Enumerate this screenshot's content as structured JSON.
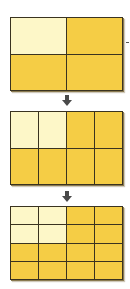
{
  "colors": {
    "light": "#FDF7C8",
    "dark": "#F5CD45",
    "line": "#3a3320",
    "arrow": "#4a4a4a"
  },
  "stages": [
    {
      "name": "stage-1",
      "rows": 2,
      "cols": 2,
      "top": 17,
      "height": 74,
      "shaded_light": [
        [
          0,
          0
        ]
      ]
    },
    {
      "name": "stage-2",
      "rows": 2,
      "cols": 4,
      "top": 111,
      "height": 74,
      "shaded_light": [
        [
          0,
          0
        ],
        [
          0,
          1
        ]
      ]
    },
    {
      "name": "stage-3",
      "rows": 4,
      "cols": 4,
      "top": 206,
      "height": 74,
      "shaded_light": [
        [
          0,
          0
        ],
        [
          0,
          1
        ],
        [
          1,
          0
        ],
        [
          1,
          1
        ]
      ]
    }
  ],
  "arrows": [
    {
      "top": 93
    },
    {
      "top": 189
    }
  ]
}
